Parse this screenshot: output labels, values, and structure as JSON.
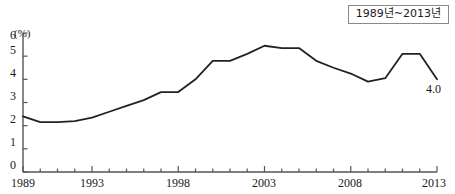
{
  "legend": {
    "period_label": "1989년~2013년"
  },
  "axis": {
    "unit_label": "(%)",
    "y_ticks": [
      "0",
      "1",
      "2",
      "3",
      "4",
      "5",
      "6"
    ],
    "x_ticks": [
      "1989",
      "1993",
      "1998",
      "2003",
      "2008",
      "2013"
    ]
  },
  "end_value_label": "4.0",
  "colors": {
    "line": "#222222",
    "axis": "#555555",
    "legend_border": "#8a8a8a",
    "background": "#ffffff"
  },
  "chart_data": {
    "type": "line",
    "title": "",
    "subtitle": "",
    "xlabel": "",
    "ylabel": "(%)",
    "xlim": [
      1989,
      2013
    ],
    "ylim": [
      0,
      6
    ],
    "grid": false,
    "legend_position": "top-right",
    "legend_entries": [
      "1989년~2013년"
    ],
    "annotations": [
      {
        "text": "4.0",
        "x": 2013,
        "y": 4.0
      }
    ],
    "x": [
      1989,
      1990,
      1991,
      1992,
      1993,
      1994,
      1995,
      1996,
      1997,
      1998,
      1999,
      2000,
      2001,
      2002,
      2003,
      2004,
      2005,
      2006,
      2007,
      2008,
      2009,
      2010,
      2011,
      2012,
      2013
    ],
    "series": [
      {
        "name": "1989년~2013년",
        "values": [
          2.4,
          2.15,
          2.15,
          2.2,
          2.35,
          2.6,
          2.85,
          3.1,
          3.45,
          3.45,
          4.0,
          4.8,
          4.8,
          5.1,
          5.45,
          5.35,
          5.35,
          4.8,
          4.5,
          4.25,
          3.9,
          4.05,
          5.1,
          5.1,
          4.0
        ]
      }
    ]
  }
}
